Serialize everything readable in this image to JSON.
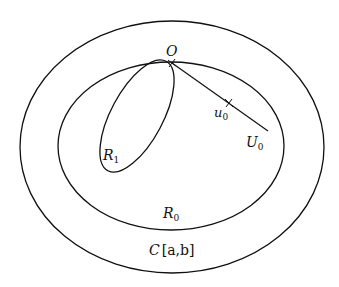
{
  "diagram": {
    "type": "set-inclusion diagram",
    "stroke_color": "#111111",
    "background": "#ffffff",
    "regions": [
      {
        "id": "outer",
        "label": "C[a,b]",
        "label_base": "C",
        "label_rest": "[a,b]"
      },
      {
        "id": "inner",
        "label": "R0",
        "label_base": "R",
        "label_sub": "0"
      },
      {
        "id": "r1",
        "label": "R1",
        "label_base": "R",
        "label_sub": "1"
      }
    ],
    "points": [
      {
        "id": "origin",
        "label": "O"
      },
      {
        "id": "u0",
        "label": "u0",
        "label_base": "u",
        "label_sub": "0"
      }
    ],
    "segments": [
      {
        "id": "U0",
        "label": "U0",
        "label_base": "U",
        "label_sub": "0",
        "from": "O"
      }
    ]
  }
}
